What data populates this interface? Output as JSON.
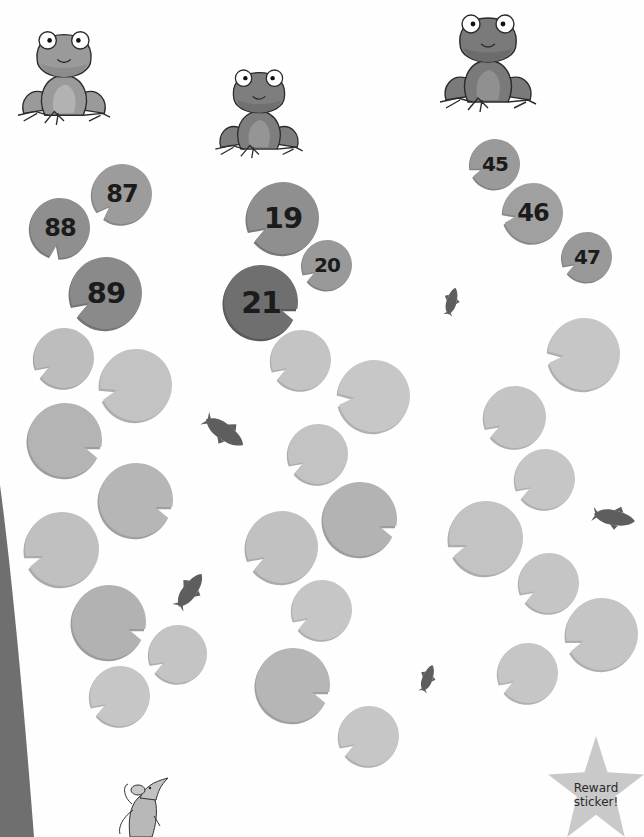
{
  "activity": {
    "frogs": [
      {
        "id": "frog-left",
        "x": 16,
        "y": 8,
        "w": 96,
        "h": 132,
        "body": "#9a9a9a",
        "belly": "#b2b2b2"
      },
      {
        "id": "frog-middle",
        "x": 198,
        "y": 60,
        "w": 122,
        "h": 100,
        "body": "#7e7e7e",
        "belly": "#959595"
      },
      {
        "id": "frog-right",
        "x": 438,
        "y": 0,
        "w": 100,
        "h": 118,
        "body": "#7a7a7a",
        "belly": "#909090"
      }
    ],
    "columns": [
      {
        "name": "left",
        "numbered_pads": [
          {
            "label": "87",
            "x": 92,
            "y": 164,
            "d": 60,
            "color": "#9c9c9c",
            "notch": 135
          },
          {
            "label": "88",
            "x": 30,
            "y": 198,
            "d": 60,
            "color": "#8f8f8f",
            "notch": 100
          },
          {
            "label": "89",
            "x": 70,
            "y": 257,
            "d": 72,
            "color": "#8a8a8a",
            "notch": 150
          }
        ],
        "blank_pads": [
          {
            "x": 34,
            "y": 328,
            "d": 60,
            "color": "#bdbdbd",
            "notch": 150
          },
          {
            "x": 100,
            "y": 349,
            "d": 72,
            "color": "#c3c3c3",
            "notch": 165
          },
          {
            "x": 28,
            "y": 403,
            "d": 74,
            "color": "#b4b4b4",
            "notch": 20
          },
          {
            "x": 99,
            "y": 463,
            "d": 74,
            "color": "#b6b6b6",
            "notch": 20
          },
          {
            "x": 25,
            "y": 512,
            "d": 74,
            "color": "#c0c0c0",
            "notch": 160
          },
          {
            "x": 72,
            "y": 585,
            "d": 74,
            "color": "#b2b2b2",
            "notch": 20
          },
          {
            "x": 149,
            "y": 625,
            "d": 58,
            "color": "#c4c4c4",
            "notch": 150
          },
          {
            "x": 90,
            "y": 666,
            "d": 60,
            "color": "#c6c6c6",
            "notch": 150
          }
        ]
      },
      {
        "name": "middle",
        "numbered_pads": [
          {
            "label": "19",
            "x": 247,
            "y": 182,
            "d": 72,
            "color": "#8f8f8f",
            "notch": 150
          },
          {
            "label": "20",
            "x": 302,
            "y": 240,
            "d": 50,
            "color": "#999999",
            "notch": 150
          },
          {
            "label": "21",
            "x": 224,
            "y": 265,
            "d": 74,
            "color": "#6f6f6f",
            "notch": 20
          }
        ],
        "blank_pads": [
          {
            "x": 271,
            "y": 330,
            "d": 60,
            "color": "#c4c4c4",
            "notch": 150
          },
          {
            "x": 338,
            "y": 360,
            "d": 72,
            "color": "#c7c7c7",
            "notch": 175
          },
          {
            "x": 288,
            "y": 424,
            "d": 60,
            "color": "#c3c3c3",
            "notch": 150
          },
          {
            "x": 323,
            "y": 482,
            "d": 74,
            "color": "#b3b3b3",
            "notch": 20
          },
          {
            "x": 246,
            "y": 511,
            "d": 72,
            "color": "#c1c1c1",
            "notch": 150
          },
          {
            "x": 292,
            "y": 580,
            "d": 60,
            "color": "#c6c6c6",
            "notch": 150
          },
          {
            "x": 256,
            "y": 648,
            "d": 74,
            "color": "#b6b6b6",
            "notch": 20
          },
          {
            "x": 339,
            "y": 706,
            "d": 60,
            "color": "#c6c6c6",
            "notch": 150
          }
        ]
      },
      {
        "name": "right",
        "numbered_pads": [
          {
            "label": "45",
            "x": 470,
            "y": 139,
            "d": 50,
            "color": "#9a9a9a",
            "notch": 160
          },
          {
            "label": "46",
            "x": 503,
            "y": 183,
            "d": 60,
            "color": "#a0a0a0",
            "notch": 170
          },
          {
            "label": "47",
            "x": 562,
            "y": 232,
            "d": 50,
            "color": "#999999",
            "notch": 150
          }
        ],
        "blank_pads": [
          {
            "x": 548,
            "y": 318,
            "d": 72,
            "color": "#c6c6c6",
            "notch": 175
          },
          {
            "x": 484,
            "y": 386,
            "d": 62,
            "color": "#c4c4c4",
            "notch": 150
          },
          {
            "x": 515,
            "y": 449,
            "d": 60,
            "color": "#c6c6c6",
            "notch": 150
          },
          {
            "x": 449,
            "y": 501,
            "d": 74,
            "color": "#c3c3c3",
            "notch": 160
          },
          {
            "x": 519,
            "y": 553,
            "d": 60,
            "color": "#c5c5c5",
            "notch": 150
          },
          {
            "x": 566,
            "y": 598,
            "d": 72,
            "color": "#c5c5c5",
            "notch": 160
          },
          {
            "x": 498,
            "y": 643,
            "d": 60,
            "color": "#c6c6c6",
            "notch": 150
          }
        ]
      }
    ],
    "fish": [
      {
        "id": "fish-1",
        "x": 200,
        "y": 410,
        "w": 52,
        "h": 46,
        "rot": 35
      },
      {
        "id": "fish-2",
        "x": 168,
        "y": 560,
        "w": 46,
        "h": 58,
        "rot": -55
      },
      {
        "id": "fish-3",
        "x": 436,
        "y": 268,
        "w": 32,
        "h": 64,
        "rot": -75
      },
      {
        "id": "fish-4",
        "x": 412,
        "y": 650,
        "w": 32,
        "h": 54,
        "rot": -70
      },
      {
        "id": "fish-5",
        "x": 592,
        "y": 500,
        "w": 48,
        "h": 36,
        "rot": 10
      }
    ],
    "character": {
      "name": "mouse",
      "x": 100,
      "y": 770,
      "w": 70,
      "h": 67
    },
    "reward_sticker": {
      "line1": "Reward",
      "line2": "sticker!",
      "x": 548,
      "y": 736,
      "w": 96,
      "h": 101,
      "color": "#c9c9c9"
    },
    "edge_color": "#6f6f6f"
  }
}
